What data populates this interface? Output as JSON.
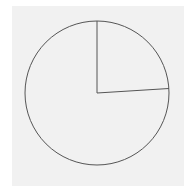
{
  "chart_data": {
    "type": "pie",
    "title": "",
    "labels": [
      "",
      ""
    ],
    "values": [
      24,
      76
    ],
    "start_angle_deg": 90,
    "direction": "clockwise",
    "fill": "none",
    "stroke_color": "#555555",
    "background_color": "#f1f1f1",
    "legend": "none"
  }
}
